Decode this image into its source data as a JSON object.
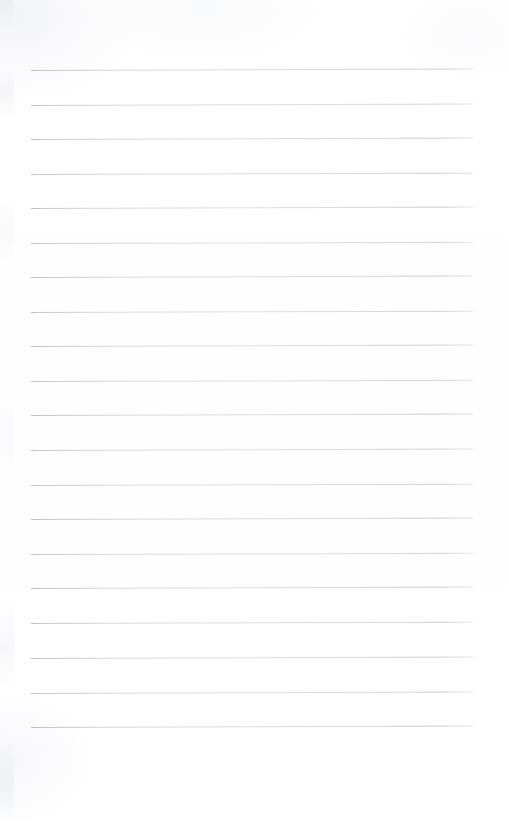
{
  "document": {
    "kind": "scanned-notebook-page",
    "title": "Blank Ruled Notebook Page",
    "page_width": 509,
    "page_height": 826,
    "background_color": "#fefeff",
    "body_text": "",
    "header_text": "",
    "footer_text": "",
    "page_number": ""
  },
  "ruling": {
    "line_color": "#c9ccd0",
    "line_color_dark_end": "#9699a0",
    "line_count": 20,
    "line_thickness_px": 1,
    "line_left_x": 31,
    "line_right_x": 473,
    "line_length_px": 442,
    "first_line_y": 70,
    "last_line_y": 727,
    "line_spacing_px": 34.6,
    "has_left_margin_rule": false,
    "has_header_rule": false,
    "top_margin_px": 70,
    "bottom_margin_px": 99,
    "left_margin_px": 31,
    "right_margin_px": 36,
    "lines": [
      {
        "index": 1,
        "y": 70,
        "opacity": 0.95,
        "slant_px": 1.6
      },
      {
        "index": 2,
        "y": 105,
        "opacity": 0.9,
        "slant_px": 1.4
      },
      {
        "index": 3,
        "y": 139,
        "opacity": 0.93,
        "slant_px": 1.5
      },
      {
        "index": 4,
        "y": 174,
        "opacity": 0.88,
        "slant_px": 1.3
      },
      {
        "index": 5,
        "y": 208,
        "opacity": 0.92,
        "slant_px": 1.5
      },
      {
        "index": 6,
        "y": 243,
        "opacity": 0.87,
        "slant_px": 1.2
      },
      {
        "index": 7,
        "y": 277,
        "opacity": 0.94,
        "slant_px": 1.6
      },
      {
        "index": 8,
        "y": 312,
        "opacity": 0.89,
        "slant_px": 1.3
      },
      {
        "index": 9,
        "y": 346,
        "opacity": 0.91,
        "slant_px": 1.5
      },
      {
        "index": 10,
        "y": 381,
        "opacity": 0.86,
        "slant_px": 1.2
      },
      {
        "index": 11,
        "y": 415,
        "opacity": 0.93,
        "slant_px": 1.5
      },
      {
        "index": 12,
        "y": 450,
        "opacity": 0.88,
        "slant_px": 1.4
      },
      {
        "index": 13,
        "y": 485,
        "opacity": 0.9,
        "slant_px": 1.3
      },
      {
        "index": 14,
        "y": 519,
        "opacity": 0.94,
        "slant_px": 1.6
      },
      {
        "index": 15,
        "y": 554,
        "opacity": 0.87,
        "slant_px": 1.2
      },
      {
        "index": 16,
        "y": 588,
        "opacity": 0.92,
        "slant_px": 1.5
      },
      {
        "index": 17,
        "y": 623,
        "opacity": 0.89,
        "slant_px": 1.3
      },
      {
        "index": 18,
        "y": 658,
        "opacity": 0.93,
        "slant_px": 1.5
      },
      {
        "index": 19,
        "y": 693,
        "opacity": 0.9,
        "slant_px": 1.4
      },
      {
        "index": 20,
        "y": 727,
        "opacity": 0.95,
        "slant_px": 1.6
      }
    ]
  }
}
